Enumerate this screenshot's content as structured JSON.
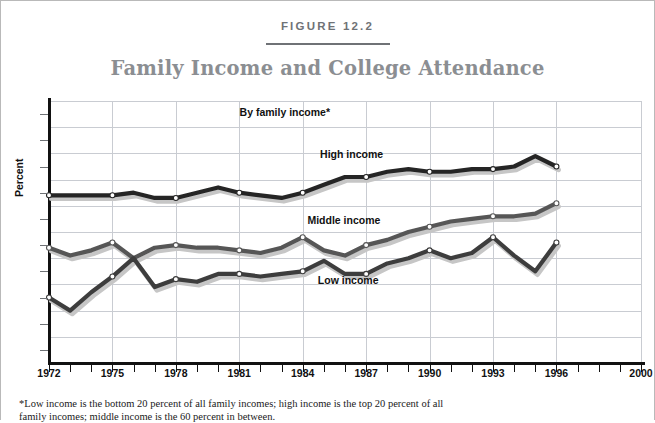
{
  "figure": {
    "number": "FIGURE 12.2",
    "title": "Family Income and College Attendance",
    "footnote_line1": "*Low income is the bottom 20 percent of all family incomes; high income is the top 20 percent of all",
    "footnote_line2": "family incomes; middle income is the 60 percent in between."
  },
  "annotations": {
    "group_label": "By family income*",
    "high_label": "High income",
    "middle_label": "Middle income",
    "low_label": "Low income"
  },
  "colors": {
    "high": "#252525",
    "middle": "#565656",
    "low": "#3d3d3d",
    "shadow": "#c6c6c6",
    "grid": "#c9ccd2",
    "axis": "#111111",
    "title": "#8b8e92",
    "fig_number": "#6f7276"
  },
  "chart_data": {
    "type": "line",
    "title": "Family Income and College Attendance",
    "xlabel": "",
    "ylabel": "Percent",
    "xlim": [
      1972,
      2000
    ],
    "ylim": [
      0,
      100
    ],
    "grid": true,
    "legend": "inline-labels",
    "x_ticks": [
      1972,
      1975,
      1978,
      1981,
      1984,
      1987,
      1990,
      1993,
      1996,
      2000
    ],
    "y_ticks": [
      0,
      10,
      20,
      30,
      40,
      50,
      60,
      70,
      80,
      90,
      100
    ],
    "x_minor_tick_interval": 1,
    "marker": "open-circle at labeled years only",
    "x": [
      1972,
      1973,
      1974,
      1975,
      1976,
      1977,
      1978,
      1979,
      1980,
      1981,
      1982,
      1983,
      1984,
      1985,
      1986,
      1987,
      1988,
      1989,
      1990,
      1991,
      1992,
      1993,
      1994,
      1995,
      1996
    ],
    "series": [
      {
        "name": "High income",
        "color": "#252525",
        "values": [
          64,
          64,
          64,
          64,
          65,
          63,
          63,
          65,
          67,
          65,
          64,
          63,
          65,
          68,
          71,
          71,
          73,
          74,
          73,
          73,
          74,
          74,
          75,
          79,
          75
        ]
      },
      {
        "name": "Middle income",
        "color": "#565656",
        "values": [
          44,
          41,
          43,
          46,
          40,
          44,
          45,
          44,
          44,
          43,
          42,
          44,
          48,
          43,
          41,
          45,
          47,
          50,
          52,
          54,
          55,
          56,
          56,
          57,
          61
        ]
      },
      {
        "name": "Low income",
        "color": "#3d3d3d",
        "values": [
          25,
          20,
          27,
          33,
          40,
          29,
          32,
          31,
          34,
          34,
          33,
          34,
          35,
          39,
          34,
          34,
          38,
          40,
          43,
          40,
          42,
          48,
          41,
          35,
          46
        ]
      }
    ]
  }
}
